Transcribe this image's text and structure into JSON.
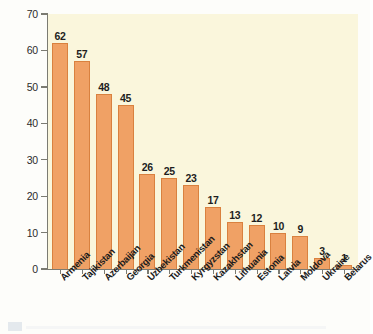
{
  "chart_data": {
    "type": "bar",
    "title": "",
    "subtitle": "",
    "xlabel": "",
    "ylabel": "",
    "ylim": [
      0,
      70
    ],
    "yticks": [
      0,
      10,
      20,
      30,
      40,
      50,
      60,
      70
    ],
    "grid": false,
    "legend": null,
    "categories": [
      "Armenia",
      "Tajikistan",
      "Azerbaijan",
      "Georgia",
      "Uzbekistan",
      "Turkmenistan",
      "Kyrgyzstan",
      "Kazakhstan",
      "Lithuania",
      "Estonia",
      "Latvia",
      "Moldova",
      "Ukraine",
      "Belarus"
    ],
    "values": [
      62,
      57,
      48,
      45,
      26,
      25,
      23,
      17,
      13,
      12,
      10,
      9,
      3,
      1
    ],
    "bar_label_format": "integer",
    "colors": {
      "bar_fill": "#f0a165",
      "bar_border": "#d9813f",
      "plot_background": "#faf6dc",
      "figure_background": "#fdfdfa",
      "axis_line": "#7b7b72",
      "text": "#1e1e1e"
    }
  }
}
